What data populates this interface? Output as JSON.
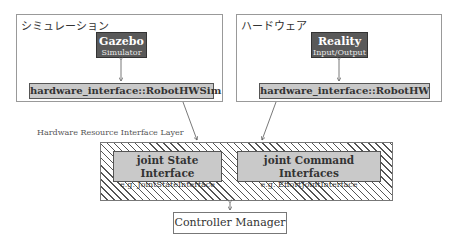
{
  "simulation": {
    "group_label": "シミュレーション",
    "engine": {
      "title": "Gazebo",
      "subtitle": "Simulator"
    },
    "interface": "hardware_interface::RobotHWSim"
  },
  "hardware": {
    "group_label": "ハードウェア",
    "engine": {
      "title": "Reality",
      "subtitle": "Input/Output"
    },
    "interface": "hardware_interface::RobotHW"
  },
  "layer": {
    "label": "Hardware Resource Interface Layer",
    "state_interface": {
      "title": "joint State Interface",
      "example": "e.g. JointStateInterface"
    },
    "command_interface": {
      "title": "joint Command Interfaces",
      "example": "e.g. EffortJointInterface"
    }
  },
  "controller": {
    "label": "Controller Manager"
  }
}
